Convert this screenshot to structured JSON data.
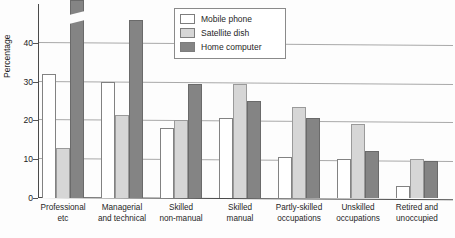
{
  "page_artifact": {
    "header_left": "",
    "header_right": ""
  },
  "chart_data": {
    "type": "bar",
    "title": "",
    "subtitle": "",
    "xlabel": "",
    "ylabel": "Percentage",
    "ylim": [
      0,
      50
    ],
    "yticks": [
      0,
      10,
      20,
      30,
      40
    ],
    "ytick_labels": [
      "0",
      "10",
      "20",
      "30",
      "40"
    ],
    "grid": true,
    "grid_axis": "y",
    "legend_position": "top-center",
    "categories": [
      "Professional etc",
      "Managerial and technical",
      "Skilled non-manual",
      "Skilled manual",
      "Partly-skilled occupations",
      "Unskilled occupations",
      "Retired and unoccupied"
    ],
    "category_lines": [
      [
        "Professional",
        "etc"
      ],
      [
        "Managerial",
        "and technical"
      ],
      [
        "Skilled",
        "non-manual"
      ],
      [
        "Skilled",
        "manual"
      ],
      [
        "Partly-skilled",
        "occupations"
      ],
      [
        "Unskilled",
        "occupations"
      ],
      [
        "Retired and",
        "unoccupied"
      ]
    ],
    "series": [
      {
        "name": "Mobile phone",
        "color": "#ffffff",
        "values": [
          32,
          30,
          18,
          20.5,
          10.5,
          10,
          3
        ]
      },
      {
        "name": "Satellite dish",
        "color": "#d6d6d6",
        "values": [
          13,
          21.5,
          20,
          29.5,
          23.5,
          19,
          10
        ]
      },
      {
        "name": "Home computer",
        "color": "#848484",
        "values": [
          49,
          46,
          29.5,
          25,
          20.5,
          12,
          9.5
        ],
        "truncated_index": 0
      }
    ]
  },
  "legend": {
    "items": [
      {
        "label": "Mobile phone",
        "color": "#ffffff"
      },
      {
        "label": "Satellite dish",
        "color": "#d6d6d6"
      },
      {
        "label": "Home computer",
        "color": "#848484"
      }
    ]
  }
}
